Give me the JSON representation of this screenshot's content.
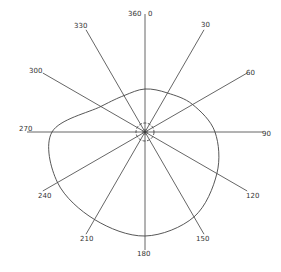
{
  "diagram": {
    "type": "polar",
    "center": [
      145,
      132
    ],
    "spoke_length": 118,
    "colors": {
      "line": "#555555",
      "curve": "#444444",
      "text": "#333333",
      "background": "#ffffff"
    },
    "labels": [
      {
        "angle": 0,
        "text": "0",
        "x": 148,
        "y": 16
      },
      {
        "angle": 360,
        "text": "360",
        "x": 128,
        "y": 16
      },
      {
        "angle": 30,
        "text": "30",
        "x": 201,
        "y": 27
      },
      {
        "angle": 60,
        "text": "60",
        "x": 246,
        "y": 75
      },
      {
        "angle": 90,
        "text": "90",
        "x": 262,
        "y": 136
      },
      {
        "angle": 120,
        "text": "120",
        "x": 246,
        "y": 198
      },
      {
        "angle": 150,
        "text": "150",
        "x": 196,
        "y": 241
      },
      {
        "angle": 180,
        "text": "180",
        "x": 137,
        "y": 256
      },
      {
        "angle": 210,
        "text": "210",
        "x": 80,
        "y": 241
      },
      {
        "angle": 240,
        "text": "240",
        "x": 38,
        "y": 198
      },
      {
        "angle": 270,
        "text": "270",
        "x": 19,
        "y": 131
      },
      {
        "angle": 300,
        "text": "300",
        "x": 29,
        "y": 73
      },
      {
        "angle": 330,
        "text": "330",
        "x": 74,
        "y": 28
      }
    ],
    "spokes": [
      0,
      30,
      60,
      90,
      120,
      150,
      180,
      210,
      240,
      270,
      300,
      330
    ],
    "curve_radii": [
      {
        "angle": 0,
        "r": 43
      },
      {
        "angle": 30,
        "r": 45
      },
      {
        "angle": 60,
        "r": 55
      },
      {
        "angle": 90,
        "r": 70
      },
      {
        "angle": 120,
        "r": 83
      },
      {
        "angle": 150,
        "r": 98
      },
      {
        "angle": 180,
        "r": 104
      },
      {
        "angle": 210,
        "r": 101
      },
      {
        "angle": 240,
        "r": 101
      },
      {
        "angle": 270,
        "r": 93
      },
      {
        "angle": 300,
        "r": 51
      },
      {
        "angle": 330,
        "r": 42
      }
    ],
    "inner_circle_radius": 9
  }
}
